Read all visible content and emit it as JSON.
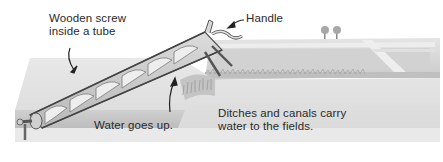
{
  "diagram": {
    "labels": {
      "screw": [
        "Wooden screw",
        "inside a tube"
      ],
      "handle": "Handle",
      "water": "Water goes up.",
      "ditches": [
        "Ditches and canals carry",
        "water to the fields."
      ]
    },
    "colors": {
      "background": "#ffffff",
      "ground_light": "#e6e6e6",
      "ground_mid": "#cfcfcf",
      "ground_dark": "#bdbdbd",
      "field": "#d4d4d4",
      "canal": "#ececec",
      "tube_outline": "#555555",
      "screw_fill": "#c8c8c8",
      "screw_highlight": "#f2f2f2",
      "text": "#2a2a2a"
    }
  }
}
